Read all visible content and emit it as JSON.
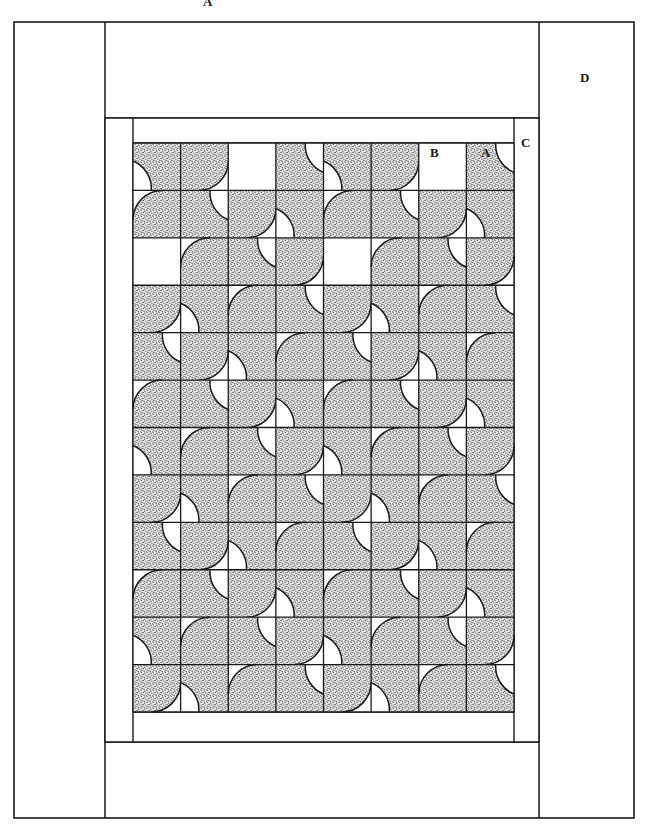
{
  "figure": {
    "pattern_name": "Drunkard's Path",
    "labels": [
      {
        "id": "A-top",
        "text": "A",
        "note": "top partial label, cropped at image edge"
      },
      {
        "id": "B",
        "text": "B",
        "note": "plain background square in pieced grid"
      },
      {
        "id": "A-unit",
        "text": "A",
        "note": "quarter-circle pieced unit"
      },
      {
        "id": "C",
        "text": "C",
        "note": "inner border strip"
      },
      {
        "id": "D",
        "text": "D",
        "note": "outer border strip"
      }
    ],
    "colors": {
      "line": "#1a1a1a",
      "background": "#ffffff",
      "patch_fill": "#cfcfcf",
      "patch_stipple": "#2b2b2b"
    },
    "geometry": {
      "outer_border": {
        "x": 14,
        "y": 22,
        "width": 620,
        "height": 796
      },
      "outer_inner_seam_left": 105,
      "outer_inner_seam_right": 539,
      "outer_top_seam": 118,
      "outer_bottom_seam": 742,
      "inner_border": {
        "x": 105,
        "y": 118,
        "width": 434,
        "height": 624
      },
      "quilt_center": {
        "x": 133,
        "y": 143,
        "width": 381,
        "height": 569
      },
      "columns": 8,
      "rows": 12,
      "cell_width": 47.625,
      "cell_height": 47.4166
    }
  },
  "chart_data": {
    "type": "diagram",
    "grid": {
      "columns": 8,
      "rows": 12
    },
    "piece_legend": [
      {
        "key": "A",
        "description": "quarter-circle pieced unit (shaded arc patch)"
      },
      {
        "key": "B",
        "description": "plain square of background fabric"
      },
      {
        "key": "C",
        "description": "inner border"
      },
      {
        "key": "D",
        "description": "outer border"
      }
    ],
    "cell_codes": [
      [
        "f0",
        "f1",
        "e0",
        "f2",
        "f0",
        "f1",
        "e0",
        "f2"
      ],
      [
        "f3",
        "f2",
        "f1",
        "f0",
        "f3",
        "f2",
        "f1",
        "f0"
      ],
      [
        "e0",
        "f3",
        "f2",
        "f1",
        "e0",
        "f3",
        "f2",
        "f1"
      ],
      [
        "f1",
        "f0",
        "f3",
        "f2",
        "f1",
        "f0",
        "f3",
        "f2"
      ],
      [
        "f2",
        "f1",
        "f0",
        "f3",
        "f2",
        "f1",
        "f0",
        "f3"
      ],
      [
        "f3",
        "f2",
        "f1",
        "f0",
        "f3",
        "f2",
        "f1",
        "f0"
      ],
      [
        "f0",
        "f3",
        "f2",
        "f1",
        "f0",
        "f3",
        "f2",
        "f1"
      ],
      [
        "f1",
        "f0",
        "f3",
        "f2",
        "f1",
        "f0",
        "f3",
        "f2"
      ],
      [
        "f2",
        "f1",
        "f0",
        "f3",
        "f2",
        "f1",
        "f0",
        "f3"
      ],
      [
        "f3",
        "f2",
        "f1",
        "f0",
        "f3",
        "f2",
        "f1",
        "f0"
      ],
      [
        "f0",
        "f3",
        "f2",
        "f1",
        "f0",
        "f3",
        "f2",
        "f1"
      ],
      [
        "f1",
        "f0",
        "f3",
        "f2",
        "f1",
        "f0",
        "f3",
        "f2"
      ]
    ],
    "code_meaning": {
      "f0": "arc patch anchored at top-left corner",
      "f1": "arc patch anchored at top-right corner",
      "f2": "arc patch anchored at bottom-right corner",
      "f3": "arc patch anchored at bottom-left corner",
      "e0": "plain (unpieced) background square"
    }
  }
}
